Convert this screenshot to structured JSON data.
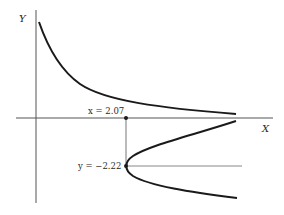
{
  "diagram": {
    "axes": {
      "x_label": "X",
      "y_label": "Y"
    },
    "annotations": {
      "x_point": "x = 2.07",
      "y_point": "y = −2.22"
    },
    "curves": [
      {
        "name": "upper-decreasing-curve",
        "description": "decreasing convex curve in first quadrant approaching X axis"
      },
      {
        "name": "lower-parabola-curve",
        "description": "sideways parabola opening to the right with vertex below X axis"
      }
    ],
    "colors": {
      "curve": "#1a1a1a",
      "axis": "#555555",
      "guide": "#777777"
    }
  }
}
